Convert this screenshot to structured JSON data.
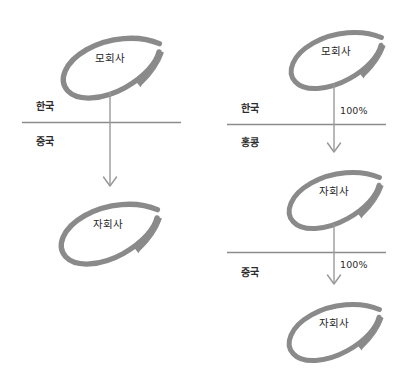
{
  "diagram": {
    "title": "",
    "colors": {
      "ellipse_stroke": "#8a8a8a",
      "arrow_line": "#9a9a9a",
      "divider_line": "#8c8c8c",
      "text": "#262626",
      "background": "#ffffff"
    },
    "left_structure": {
      "nodes": [
        {
          "id": "left-parent",
          "label": "모회사"
        },
        {
          "id": "left-sub",
          "label": "자회사"
        }
      ],
      "regions": [
        {
          "id": "left-region-above",
          "label": "한국"
        },
        {
          "id": "left-region-below",
          "label": "중국"
        }
      ],
      "ownership": []
    },
    "right_structure": {
      "nodes": [
        {
          "id": "right-parent",
          "label": "모회사"
        },
        {
          "id": "right-sub-1",
          "label": "자회사"
        },
        {
          "id": "right-sub-2",
          "label": "자회사"
        }
      ],
      "regions": [
        {
          "id": "right-region-1",
          "label": "한국"
        },
        {
          "id": "right-region-2",
          "label": "홍콩"
        },
        {
          "id": "right-region-3",
          "label": "중국"
        }
      ],
      "ownership": [
        {
          "id": "right-pct-1",
          "label": "100%"
        },
        {
          "id": "right-pct-2",
          "label": "100%"
        }
      ]
    }
  }
}
